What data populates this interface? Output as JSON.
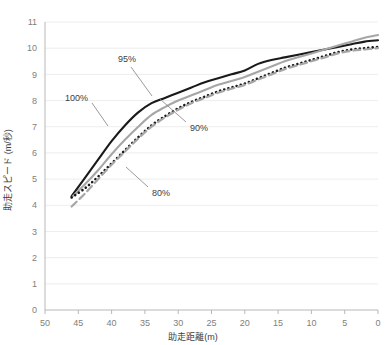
{
  "chart_data": {
    "type": "line",
    "title": "",
    "xlabel": "助走距離(m)",
    "ylabel": "助走スピード (m/秒)",
    "xlim": [
      50,
      0
    ],
    "ylim": [
      0,
      11
    ],
    "x_ticks": [
      50,
      45,
      40,
      35,
      30,
      25,
      20,
      15,
      10,
      5,
      0
    ],
    "y_ticks": [
      0,
      1,
      2,
      3,
      4,
      5,
      6,
      7,
      8,
      9,
      10,
      11
    ],
    "x_axis_reversed": true,
    "grid": "horizontal",
    "legend": "inline-annotations",
    "x": [
      46,
      44,
      42,
      40,
      38,
      36,
      34,
      32,
      30,
      28,
      26,
      24,
      22,
      20,
      18,
      16,
      14,
      12,
      10,
      8,
      6,
      4,
      2,
      0
    ],
    "series": [
      {
        "name": "100%",
        "style": "solid",
        "color": "#1a1a1a",
        "values": [
          4.35,
          5.05,
          5.75,
          6.45,
          7.05,
          7.55,
          7.9,
          8.1,
          8.3,
          8.5,
          8.7,
          8.85,
          9.0,
          9.15,
          9.4,
          9.55,
          9.65,
          9.75,
          9.85,
          9.95,
          10.05,
          10.15,
          10.25,
          10.3
        ]
      },
      {
        "name": "95%",
        "style": "solid",
        "color": "#a6a6a6",
        "values": [
          4.3,
          4.8,
          5.35,
          5.95,
          6.5,
          7.0,
          7.45,
          7.75,
          8.0,
          8.2,
          8.4,
          8.6,
          8.75,
          8.9,
          9.1,
          9.3,
          9.5,
          9.65,
          9.8,
          9.95,
          10.1,
          10.25,
          10.4,
          10.5
        ]
      },
      {
        "name": "90%",
        "style": "dotted",
        "color": "#1a1a1a",
        "values": [
          4.3,
          4.65,
          5.1,
          5.6,
          6.1,
          6.6,
          7.05,
          7.4,
          7.7,
          7.95,
          8.15,
          8.35,
          8.5,
          8.65,
          8.85,
          9.05,
          9.25,
          9.4,
          9.55,
          9.7,
          9.85,
          9.95,
          10.0,
          10.05
        ]
      },
      {
        "name": "80%",
        "style": "dashed",
        "color": "#a6a6a6",
        "values": [
          3.95,
          4.45,
          5.0,
          5.55,
          6.05,
          6.55,
          7.0,
          7.35,
          7.65,
          7.9,
          8.1,
          8.3,
          8.45,
          8.6,
          8.8,
          9.0,
          9.2,
          9.35,
          9.5,
          9.65,
          9.8,
          9.9,
          9.95,
          10.0
        ]
      }
    ],
    "annotations": [
      {
        "text": "100%",
        "x_value": 43.5,
        "y_value": 7.1,
        "anchor": "end"
      },
      {
        "text": "95%",
        "x_value": 38.0,
        "y_value": 9.05,
        "anchor": "middle"
      },
      {
        "text": "90%",
        "x_value": 28.5,
        "y_value": 6.55,
        "anchor": "start"
      },
      {
        "text": "80%",
        "x_value": 37.0,
        "y_value": 4.45,
        "anchor": "start"
      }
    ]
  }
}
